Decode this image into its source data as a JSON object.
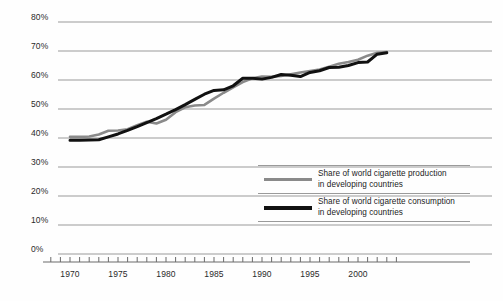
{
  "chart_data": {
    "type": "line",
    "title": "",
    "subtitle": "",
    "xlabel": "",
    "ylabel": "",
    "xlim": [
      1968,
      2005
    ],
    "ylim": [
      0,
      80
    ],
    "grid": true,
    "grid_axis": "y",
    "legend_position": "inside-bottom-right",
    "y_ticks": [
      0,
      10,
      20,
      30,
      40,
      50,
      60,
      70,
      80
    ],
    "y_tick_labels": [
      "0%",
      "10%",
      "20%",
      "30%",
      "40%",
      "50%",
      "60%",
      "70%",
      "80%"
    ],
    "x_ticks": [
      1968,
      1969,
      1970,
      1971,
      1972,
      1973,
      1974,
      1975,
      1976,
      1977,
      1978,
      1979,
      1980,
      1981,
      1982,
      1983,
      1984,
      1985,
      1986,
      1987,
      1988,
      1989,
      1990,
      1991,
      1992,
      1993,
      1994,
      1995,
      1996,
      1997,
      1998,
      1999,
      2000,
      2001,
      2002,
      2003,
      2004
    ],
    "x_tick_labels": [
      "1970",
      "1975",
      "1980",
      "1985",
      "1990",
      "1995",
      "2000"
    ],
    "x_labeled_ticks": [
      1970,
      1975,
      1980,
      1985,
      1990,
      1995,
      2000
    ],
    "series": [
      {
        "name": "Share of world cigarette production in developing countries",
        "color": "#8a8a8a",
        "width": 2.6,
        "x": [
          1970,
          1971,
          1972,
          1973,
          1974,
          1975,
          1976,
          1977,
          1978,
          1979,
          1980,
          1981,
          1982,
          1983,
          1984,
          1985,
          1986,
          1987,
          1988,
          1989,
          1990,
          1991,
          1992,
          1993,
          1994,
          1995,
          1996,
          1997,
          1998,
          1999,
          2000,
          2001,
          2002,
          2003
        ],
        "values": [
          40.4,
          40.4,
          40.5,
          41.2,
          42.5,
          42.6,
          43.0,
          44.4,
          45.6,
          45.0,
          46.3,
          48.9,
          50.6,
          51.2,
          51.4,
          53.6,
          55.6,
          57.5,
          59.3,
          60.6,
          61.2,
          61.1,
          61.4,
          62.0,
          62.6,
          63.1,
          63.6,
          64.6,
          65.6,
          66.2,
          67.0,
          68.4,
          69.4,
          69.6
        ]
      },
      {
        "name": "Share of world cigarette consumption in developing countries",
        "color": "#111111",
        "width": 3.0,
        "x": [
          1970,
          1971,
          1972,
          1973,
          1974,
          1975,
          1976,
          1977,
          1978,
          1979,
          1980,
          1981,
          1982,
          1983,
          1984,
          1985,
          1986,
          1987,
          1988,
          1989,
          1990,
          1991,
          1992,
          1993,
          1994,
          1995,
          1996,
          1997,
          1998,
          1999,
          2000,
          2001,
          2002,
          2003
        ],
        "values": [
          39.2,
          39.2,
          39.3,
          39.4,
          40.4,
          41.4,
          42.6,
          43.9,
          45.3,
          46.7,
          48.2,
          49.8,
          51.5,
          53.3,
          55.1,
          56.4,
          56.6,
          58.0,
          60.6,
          60.6,
          60.3,
          60.9,
          61.9,
          61.6,
          61.2,
          62.6,
          63.2,
          64.3,
          64.4,
          65.0,
          66.0,
          66.2,
          68.9,
          69.4
        ]
      }
    ],
    "legend": [
      {
        "color": "#8a8a8a",
        "line1": "Share of world cigarette production",
        "line2": "in developing countries"
      },
      {
        "color": "#111111",
        "line1": "Share of world cigarette consumption",
        "line2": "in developing countries"
      }
    ]
  },
  "colors": {
    "gridline": "#9a9a9a",
    "axis": "#6b6b6b",
    "production": "#8a8a8a",
    "consumption": "#111111",
    "background": "#fefefe",
    "text": "#2a2a2a"
  }
}
